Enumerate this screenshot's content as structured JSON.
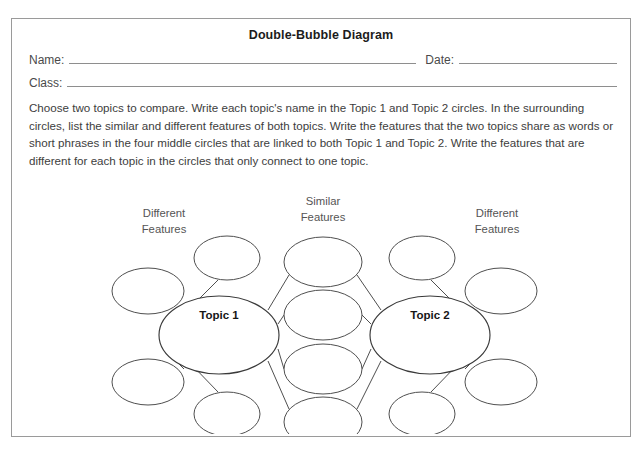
{
  "page": {
    "clipped_top_text": "",
    "clipped_bottom_text": ""
  },
  "worksheet": {
    "title": "Double-Bubble Diagram",
    "fields": {
      "name_label": "Name:",
      "date_label": "Date:",
      "class_label": "Class:",
      "name_value": "",
      "date_value": "",
      "class_value": ""
    },
    "instructions": "Choose two topics to compare. Write each topic's name in the Topic 1 and Topic 2 circles. In the surrounding circles, list the similar and different features of both topics. Write the features that the two topics share as words or short phrases in the four middle circles that are linked to both Topic 1 and Topic 2. Write the features that are different for each topic in the circles that only connect to one topic."
  },
  "diagram": {
    "labels": {
      "left": "Different\nFeatures",
      "left_line1": "Different",
      "left_line2": "Features",
      "center_line1": "Similar",
      "center_line2": "Features",
      "right_line1": "Different",
      "right_line2": "Features"
    },
    "topics": [
      {
        "id": "topic-1",
        "label": "Topic 1",
        "cx": 207,
        "cy": 166,
        "rx": 60,
        "ry": 39
      },
      {
        "id": "topic-2",
        "label": "Topic 2",
        "cx": 418,
        "cy": 166,
        "rx": 60,
        "ry": 39
      }
    ],
    "similar_bubbles": [
      {
        "id": "similar-1",
        "text": "",
        "cx": 311,
        "cy": 93,
        "rx": 39,
        "ry": 25
      },
      {
        "id": "similar-2",
        "text": "",
        "cx": 311,
        "cy": 146,
        "rx": 39,
        "ry": 25
      },
      {
        "id": "similar-3",
        "text": "",
        "cx": 311,
        "cy": 200,
        "rx": 39,
        "ry": 25
      },
      {
        "id": "similar-4",
        "text": "",
        "cx": 311,
        "cy": 253,
        "rx": 39,
        "ry": 25
      }
    ],
    "different_bubbles_left": [
      {
        "id": "diff-left-1",
        "text": "",
        "cx": 215,
        "cy": 89,
        "rx": 33,
        "ry": 22
      },
      {
        "id": "diff-left-2",
        "text": "",
        "cx": 136,
        "cy": 122,
        "rx": 36,
        "ry": 23
      },
      {
        "id": "diff-left-3",
        "text": "",
        "cx": 136,
        "cy": 213,
        "rx": 36,
        "ry": 23
      },
      {
        "id": "diff-left-4",
        "text": "",
        "cx": 215,
        "cy": 245,
        "rx": 33,
        "ry": 22
      }
    ],
    "different_bubbles_right": [
      {
        "id": "diff-right-1",
        "text": "",
        "cx": 410,
        "cy": 89,
        "rx": 33,
        "ry": 22
      },
      {
        "id": "diff-right-2",
        "text": "",
        "cx": 489,
        "cy": 122,
        "rx": 36,
        "ry": 23
      },
      {
        "id": "diff-right-3",
        "text": "",
        "cx": 489,
        "cy": 213,
        "rx": 36,
        "ry": 23
      },
      {
        "id": "diff-right-4",
        "text": "",
        "cx": 410,
        "cy": 245,
        "rx": 33,
        "ry": 22
      }
    ],
    "colors": {
      "bubble_stroke": "#4f4f4f",
      "topic_stroke": "#3a3a3a",
      "frame_border": "#9a9a9a",
      "label_text": "#555555",
      "body_text": "#3d3d3d"
    }
  }
}
